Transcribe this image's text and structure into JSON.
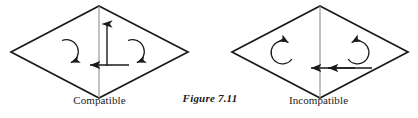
{
  "figure": {
    "number_label": "Figure 7.11",
    "stroke_color": "#1a1a1a",
    "background_color": "#ffffff",
    "panels": [
      {
        "id": "compatible",
        "label": "Compatible",
        "shape": "rhombus",
        "center_arrows": [
          {
            "name": "left-center-arrow",
            "direction": "down"
          },
          {
            "name": "right-center-arrow",
            "direction": "up"
          }
        ],
        "rotation_arrows": [
          {
            "name": "left-rotation-arrow",
            "direction": "clockwise",
            "arrowhead_position": "bottom-right"
          },
          {
            "name": "right-rotation-arrow",
            "direction": "clockwise",
            "arrowhead_position": "bottom-right"
          }
        ]
      },
      {
        "id": "incompatible",
        "label": "Incompatible",
        "shape": "rhombus",
        "center_arrows": [
          {
            "name": "left-center-arrow",
            "direction": "down"
          },
          {
            "name": "right-center-arrow",
            "direction": "down"
          }
        ],
        "rotation_arrows": [
          {
            "name": "left-rotation-arrow",
            "direction": "counter-clockwise",
            "arrowhead_position": "top-right"
          },
          {
            "name": "right-rotation-arrow",
            "direction": "clockwise",
            "arrowhead_position": "top-left"
          }
        ]
      }
    ]
  }
}
